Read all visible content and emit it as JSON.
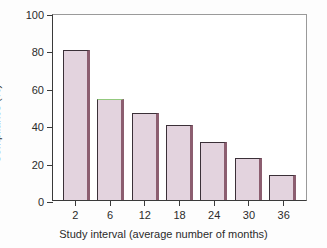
{
  "chart_data": {
    "type": "bar",
    "title": "",
    "xlabel": "Study interval (average number of months)",
    "ylabel": "Compliance (%)",
    "categories": [
      "2",
      "6",
      "12",
      "18",
      "24",
      "30",
      "36"
    ],
    "values": [
      80,
      54,
      46.5,
      40,
      31,
      22.5,
      13.5
    ],
    "ylim": [
      0,
      100
    ],
    "yticks": [
      0,
      20,
      40,
      60,
      80,
      100
    ],
    "ytick_labels": [
      "0",
      "20",
      "40",
      "60",
      "80",
      "100"
    ],
    "grid": false,
    "legend": "none",
    "bar_fill_color": "#e3d3de",
    "bar_edge_color": "#3b3038",
    "bar_shadow_color": "#8c5e70",
    "highlight_edge_color": "#93c97e",
    "highlighted_bar_index": 1,
    "axis_color": "#3a3a3a",
    "frame_color": "#9a9a9a",
    "background_color": "#ffffff"
  }
}
